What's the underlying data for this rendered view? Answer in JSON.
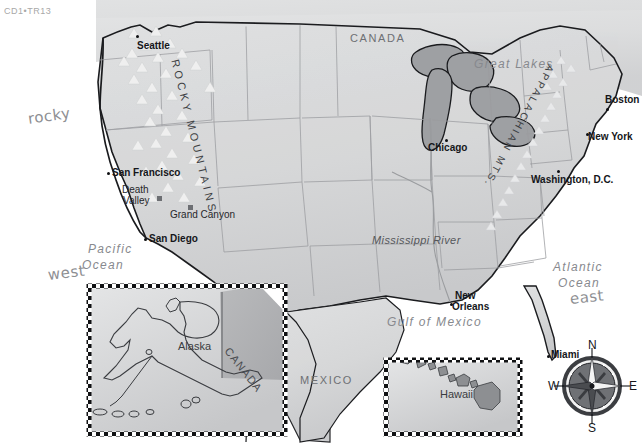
{
  "header": {
    "code": "CD1•TR13"
  },
  "map": {
    "title": "United States physical and political reference map",
    "colors": {
      "land": "#d6d7d8",
      "land_shadow": "#c2c3c5",
      "water": "#ffffff",
      "lakes": "#9fa1a4",
      "border_dark": "#1b1c1f",
      "state_border": "#9a9c9f",
      "mountain_symbol": "#efefef",
      "text_dark": "#15161a",
      "text_gray": "#87898e",
      "handwriting": "#8e8f93"
    },
    "countries": [
      {
        "name": "CANADA",
        "x": 350,
        "y": 32
      },
      {
        "name": "MEXICO",
        "x": 300,
        "y": 380
      }
    ],
    "water_bodies": [
      {
        "name": "Great Lakes",
        "x": 474,
        "y": 63
      },
      {
        "name": "Pacific Ocean",
        "line1": "Pacific",
        "line2": "Ocean",
        "x": 88,
        "y": 249
      },
      {
        "name": "Atlantic Ocean",
        "line1": "Atlantic",
        "line2": "Ocean",
        "x": 553,
        "y": 266
      },
      {
        "name": "Gulf of Mexico",
        "x": 387,
        "y": 321
      }
    ],
    "rivers": [
      {
        "name": "Mississippi River",
        "x": 372,
        "y": 240
      }
    ],
    "mountains": [
      {
        "name": "ROCKY MOUNTAINS",
        "x": 181,
        "y": 58
      },
      {
        "name": "APPALACHIAN MTS.",
        "x": 530,
        "y": 110
      }
    ],
    "cities": [
      {
        "name": "Seattle",
        "x": 137,
        "y": 44,
        "marker_x": 136,
        "marker_y": 35,
        "anchor": "left"
      },
      {
        "name": "San Francisco",
        "x": 112,
        "y": 171,
        "marker_x": 107,
        "marker_y": 172,
        "anchor": "left"
      },
      {
        "name": "San Diego",
        "x": 149,
        "y": 236,
        "marker_x": 144,
        "marker_y": 238,
        "anchor": "left"
      },
      {
        "name": "Chicago",
        "x": 432,
        "y": 146,
        "marker_x": 445,
        "marker_y": 139,
        "anchor": "left"
      },
      {
        "name": "Boston",
        "x": 607,
        "y": 98,
        "marker_x": 606,
        "marker_y": 108,
        "anchor": "left"
      },
      {
        "name": "New York",
        "x": 589,
        "y": 137,
        "marker_x": 586,
        "marker_y": 133,
        "anchor": "left"
      },
      {
        "name": "Washington, D.C.",
        "x": 532,
        "y": 177,
        "marker_x": 557,
        "marker_y": 170,
        "anchor": "left"
      },
      {
        "name": "New Orleans",
        "line1": "New",
        "line2": "Orleans",
        "x": 455,
        "y": 294,
        "marker_x": 450,
        "marker_y": 303,
        "anchor": "left"
      },
      {
        "name": "Miami",
        "x": 551,
        "y": 350,
        "marker_x": 547,
        "marker_y": 355,
        "anchor": "left"
      }
    ],
    "landmarks": [
      {
        "name": "Death Valley",
        "line1": "Death",
        "line2": "Valley",
        "x": 122,
        "y": 188,
        "marker_x": 157,
        "marker_y": 196
      },
      {
        "name": "Grand Canyon",
        "x": 170,
        "y": 214,
        "marker_x": 188,
        "marker_y": 205
      }
    ],
    "insets": [
      {
        "name": "alaska-inset",
        "labels": [
          {
            "text": "Alaska",
            "x": 180,
            "y": 345
          },
          {
            "text": "CANADA",
            "x": 232,
            "y": 356
          }
        ]
      },
      {
        "name": "hawaii-inset",
        "labels": [
          {
            "text": "Hawaii",
            "x": 442,
            "y": 393
          }
        ]
      }
    ],
    "compass": {
      "north": "N",
      "south": "S",
      "east": "E",
      "west": "W",
      "center_x": 592,
      "center_y": 386
    }
  },
  "annotations": [
    {
      "text": "rocky",
      "x": 28,
      "y": 118,
      "rotate": -8
    },
    {
      "text": "west",
      "x": 48,
      "y": 274,
      "rotate": -7
    },
    {
      "text": "east",
      "x": 570,
      "y": 298,
      "rotate": -6
    }
  ]
}
